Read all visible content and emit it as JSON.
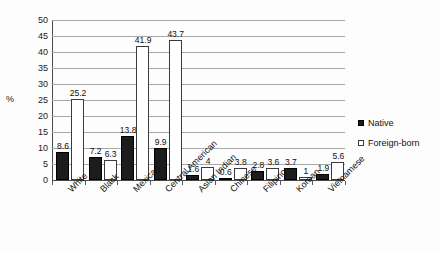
{
  "chart_data": {
    "type": "bar",
    "title": "",
    "subtitle": "",
    "xlabel": "",
    "ylabel": "%",
    "ylim": [
      0,
      50
    ],
    "ytick_step": 5,
    "yticks": [
      "50",
      "45",
      "40",
      "35",
      "30",
      "25",
      "20",
      "15",
      "10",
      "5",
      "0"
    ],
    "grid": "horizontal",
    "legend_position": "right",
    "categories": [
      "White",
      "Black",
      "Mexican",
      "Central American",
      "Asian Indian",
      "Chinese",
      "Filipino",
      "Korean",
      "Vietnamese"
    ],
    "series": [
      {
        "name": "Native",
        "color": "#1c1c1c",
        "style": "filled-square",
        "values": [
          8.6,
          7.2,
          13.8,
          9.9,
          1.6,
          0.6,
          2.8,
          3.7,
          1.9
        ],
        "labels": [
          "8.6",
          "7.2",
          "13.8",
          "9.9",
          "1.6",
          "0.6",
          "2.8",
          "3.7",
          "1.9"
        ]
      },
      {
        "name": "Foreign-born",
        "color": "#ffffff",
        "style": "open-square",
        "values": [
          25.2,
          6.3,
          41.9,
          43.7,
          4,
          3.8,
          3.6,
          1,
          5.6
        ],
        "labels": [
          "25.2",
          "6.3",
          "41.9",
          "43.7",
          "4",
          "3.8",
          "3.6",
          "1",
          "5.6"
        ]
      }
    ]
  },
  "legend": {
    "items": [
      {
        "label": "Native",
        "marker": "filled-square-icon"
      },
      {
        "label": "Foreign-born",
        "marker": "open-square-icon"
      }
    ]
  }
}
